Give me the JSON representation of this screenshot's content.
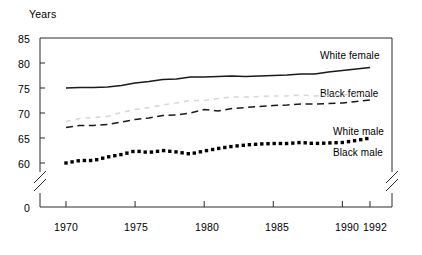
{
  "figure": {
    "y_axis_title": "Years",
    "caption": ""
  },
  "chart_data": {
    "type": "line",
    "title": "",
    "xlabel": "",
    "ylabel": "Years",
    "xlim": [
      1969.2,
      1992.6
    ],
    "ylim": [
      59.0,
      85.0
    ],
    "y_broken_axis": true,
    "y_break_between": [
      0,
      59
    ],
    "grid": false,
    "legend_position": "inline-right",
    "yticks": [
      "0",
      "60",
      "65",
      "70",
      "75",
      "80",
      "85"
    ],
    "ytick_values": [
      0,
      60,
      65,
      70,
      75,
      80,
      85
    ],
    "xticks": [
      "1970",
      "1975",
      "1980",
      "1985",
      "1990",
      "1992"
    ],
    "xtick_values": [
      1970,
      1975,
      1980,
      1985,
      1990,
      1992
    ],
    "x": [
      1970,
      1971,
      1972,
      1973,
      1974,
      1975,
      1976,
      1977,
      1978,
      1979,
      1980,
      1981,
      1982,
      1983,
      1984,
      1985,
      1986,
      1987,
      1988,
      1989,
      1990,
      1991,
      1992
    ],
    "series": [
      {
        "name": "White female",
        "label": "White female",
        "style": "solid",
        "color": "#1a1a1a",
        "values": [
          75.0,
          75.1,
          75.1,
          75.2,
          75.5,
          76.0,
          76.3,
          76.7,
          76.8,
          77.2,
          77.2,
          77.3,
          77.4,
          77.3,
          77.4,
          77.5,
          77.6,
          77.8,
          77.8,
          78.2,
          78.5,
          78.8,
          79.1
        ]
      },
      {
        "name": "Black female",
        "label": "Black female",
        "style": "dotted-faint",
        "color": "#d8d8d8",
        "values": [
          68.3,
          68.9,
          69.1,
          69.3,
          70.1,
          70.7,
          71.1,
          71.6,
          72.0,
          72.5,
          72.5,
          72.9,
          73.2,
          73.2,
          73.3,
          73.4,
          73.4,
          73.6,
          73.4,
          73.5,
          73.6,
          73.8,
          73.9
        ]
      },
      {
        "name": "White male",
        "label": "White male",
        "style": "dashed",
        "color": "#1a1a1a",
        "values": [
          67.1,
          67.5,
          67.5,
          67.7,
          68.2,
          68.7,
          69.0,
          69.5,
          69.6,
          70.0,
          70.7,
          70.4,
          70.9,
          71.1,
          71.3,
          71.5,
          71.6,
          71.8,
          71.8,
          71.9,
          72.0,
          72.3,
          72.6
        ]
      },
      {
        "name": "Black male",
        "label": "Black male",
        "style": "square-dots",
        "color": "#000000",
        "values": [
          60.0,
          60.5,
          60.5,
          61.2,
          61.7,
          62.4,
          62.1,
          62.5,
          62.2,
          61.8,
          62.4,
          62.9,
          63.3,
          63.6,
          63.8,
          63.9,
          63.9,
          64.1,
          63.9,
          64.0,
          64.1,
          64.5,
          65.0
        ]
      }
    ]
  },
  "labels": {
    "white_female": "White female",
    "black_female": "Black female",
    "white_male": "White male",
    "black_male": "Black male"
  }
}
